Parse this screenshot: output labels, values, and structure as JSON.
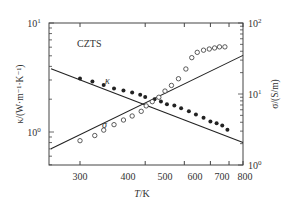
{
  "chart_data": {
    "type": "scatter",
    "title": "",
    "annotation": "CZTS",
    "xlabel": "T/K",
    "ylabel_left": "κ/(W·m⁻¹·K⁻¹)",
    "ylabel_right": "σ/(S/m)",
    "x_scale": "inverse (1/T, displayed as T)",
    "x_ticks": [
      300,
      400,
      500,
      600,
      700,
      800
    ],
    "xlim": [
      255,
      800
    ],
    "y_left_scale": "log",
    "y_left_ticks": [
      "10^0",
      "10^1"
    ],
    "y_left_lim": [
      0.5,
      10
    ],
    "y_right_scale": "log",
    "y_right_ticks": [
      "10^0",
      "10^1",
      "10^2"
    ],
    "y_right_lim": [
      1,
      100
    ],
    "grid": false,
    "series": [
      {
        "name": "κ",
        "axis": "left",
        "marker": "filled-circle",
        "x": [
          300,
          315,
          330,
          345,
          360,
          375,
          390,
          400,
          420,
          435,
          450,
          470,
          490,
          515,
          540,
          570,
          600,
          630,
          660,
          690
        ],
        "values": [
          3.1,
          2.9,
          2.7,
          2.5,
          2.4,
          2.3,
          2.2,
          2.1,
          2.0,
          1.9,
          1.8,
          1.75,
          1.65,
          1.55,
          1.45,
          1.35,
          1.25,
          1.2,
          1.15,
          1.05
        ],
        "fit_line": {
          "x": [
            270,
            800
          ],
          "values": [
            3.8,
            0.8
          ]
        }
      },
      {
        "name": "σ",
        "axis": "right",
        "marker": "open-circle",
        "x": [
          300,
          318,
          330,
          345,
          360,
          375,
          392,
          402,
          415,
          430,
          445,
          462,
          482,
          505,
          525,
          545,
          570,
          595,
          620,
          645,
          675
        ],
        "values": [
          2.2,
          2.6,
          3.1,
          3.7,
          4.3,
          4.9,
          5.7,
          6.8,
          7.8,
          9.0,
          11.0,
          13.2,
          16.4,
          22.5,
          32.5,
          38.6,
          41.4,
          43.0,
          44.5,
          46.1,
          46.1
        ],
        "fit_line": {
          "x": [
            270,
            800
          ],
          "values": [
            1.7,
            35
          ]
        }
      }
    ],
    "labels_on_plot": [
      "κ",
      "σ"
    ]
  },
  "labels": {
    "annotation": "CZTS",
    "kappa": "κ",
    "sigma": "σ",
    "xlabel_italic": "T",
    "xlabel_unit": "/K",
    "ylabel_left": "κ/(W·m⁻¹·K⁻¹)",
    "ylabel_right": "σ/(S/m)",
    "x_ticks": [
      "300",
      "400",
      "500",
      "600",
      "700",
      "800"
    ],
    "y_left_tick_top": "10",
    "y_left_tick_top_exp": "1",
    "y_left_tick_mid": "10",
    "y_left_tick_mid_exp": "0",
    "y_right_tick_top": "10",
    "y_right_tick_top_exp": "2",
    "y_right_tick_mid": "10",
    "y_right_tick_mid_exp": "1",
    "y_right_tick_bot": "10",
    "y_right_tick_bot_exp": "0"
  },
  "colors": {
    "axis": "#444444",
    "data": "#222222",
    "text": "#333333"
  }
}
